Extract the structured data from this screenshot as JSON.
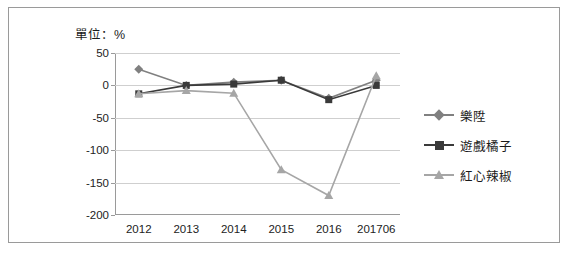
{
  "unit_label": "單位：%",
  "legend": [
    {
      "label": "樂陞",
      "color": "#808080",
      "marker": "diamond"
    },
    {
      "label": "遊戲橘子",
      "color": "#3a3a3a",
      "marker": "square"
    },
    {
      "label": "紅心辣椒",
      "color": "#a6a6a6",
      "marker": "triangle"
    }
  ],
  "chart_data": {
    "type": "line",
    "title": "",
    "subtitle": "",
    "xlabel": "",
    "ylabel": "單位：%",
    "categories": [
      "2012",
      "2013",
      "2014",
      "2015",
      "2016",
      "201706"
    ],
    "ylim": [
      -200,
      50
    ],
    "yticks": [
      50,
      0,
      -50,
      -100,
      -150,
      -200
    ],
    "ytick_labels": [
      "50",
      "0",
      "-50",
      "-100",
      "-150",
      "-200"
    ],
    "grid": true,
    "legend_position": "right",
    "series": [
      {
        "name": "樂陞",
        "color": "#808080",
        "marker": "diamond",
        "values": [
          25,
          0,
          5,
          8,
          -20,
          8
        ]
      },
      {
        "name": "遊戲橘子",
        "color": "#3a3a3a",
        "marker": "square",
        "values": [
          -13,
          0,
          2,
          8,
          -22,
          0
        ]
      },
      {
        "name": "紅心辣椒",
        "color": "#a6a6a6",
        "marker": "triangle",
        "values": [
          -13,
          -8,
          -12,
          -130,
          -170,
          15
        ]
      }
    ]
  }
}
